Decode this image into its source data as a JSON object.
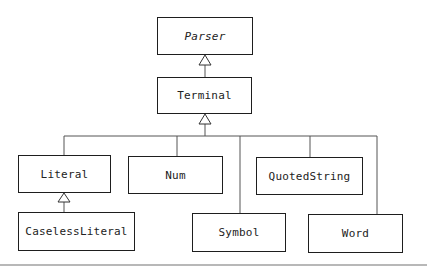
{
  "diagram": {
    "type": "uml-class-hierarchy",
    "classes": [
      {
        "id": "parser",
        "label": "Parser",
        "abstract": true
      },
      {
        "id": "terminal",
        "label": "Terminal",
        "abstract": false
      },
      {
        "id": "literal",
        "label": "Literal",
        "abstract": false
      },
      {
        "id": "num",
        "label": "Num",
        "abstract": false
      },
      {
        "id": "quotedstring",
        "label": "QuotedString",
        "abstract": false
      },
      {
        "id": "caselessliteral",
        "label": "CaselessLiteral",
        "abstract": false
      },
      {
        "id": "symbol",
        "label": "Symbol",
        "abstract": false
      },
      {
        "id": "word",
        "label": "Word",
        "abstract": false
      }
    ],
    "relationships": [
      {
        "child": "Terminal",
        "parent": "Parser",
        "kind": "generalization"
      },
      {
        "child": "Literal",
        "parent": "Terminal",
        "kind": "generalization"
      },
      {
        "child": "Num",
        "parent": "Terminal",
        "kind": "generalization"
      },
      {
        "child": "Symbol",
        "parent": "Terminal",
        "kind": "generalization"
      },
      {
        "child": "QuotedString",
        "parent": "Terminal",
        "kind": "generalization"
      },
      {
        "child": "Word",
        "parent": "Terminal",
        "kind": "generalization"
      },
      {
        "child": "CaselessLiteral",
        "parent": "Literal",
        "kind": "generalization"
      }
    ],
    "colors": {
      "stroke": "#1e1e1e",
      "connector": "#555555",
      "background": "#ffffff"
    }
  }
}
